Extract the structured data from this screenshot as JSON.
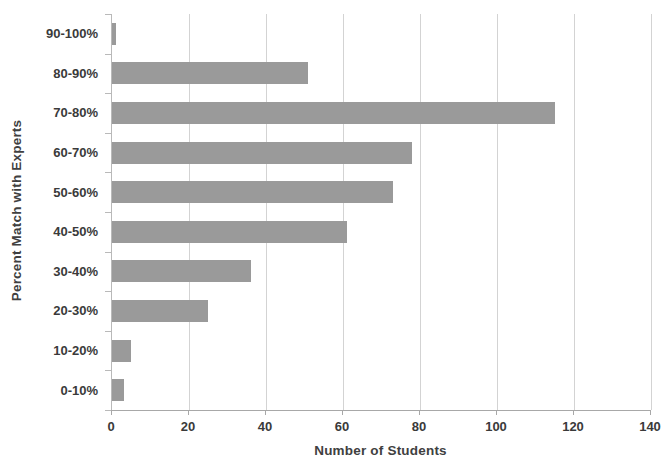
{
  "chart_data": {
    "type": "bar",
    "orientation": "horizontal",
    "title": "",
    "xlabel": "Number of Students",
    "ylabel": "Percent Match with Experts",
    "categories": [
      "0-10%",
      "10-20%",
      "20-30%",
      "30-40%",
      "40-50%",
      "50-60%",
      "60-70%",
      "70-80%",
      "80-90%",
      "90-100%"
    ],
    "values": [
      3,
      5,
      25,
      36,
      61,
      73,
      78,
      115,
      51,
      1
    ],
    "series": [
      {
        "name": "Number of Students",
        "values": [
          3,
          5,
          25,
          36,
          61,
          73,
          78,
          115,
          51,
          1
        ]
      }
    ],
    "xlim": [
      0,
      140
    ],
    "xticks": [
      0,
      20,
      40,
      60,
      80,
      100,
      120,
      140
    ],
    "xtick_labels": [
      "0",
      "20",
      "40",
      "60",
      "80",
      "100",
      "120",
      "140"
    ],
    "ytick_labels_top_to_bottom": [
      "90-100%",
      "80-90%",
      "70-80%",
      "60-70%",
      "50-60%",
      "40-50%",
      "30-40%",
      "20-30%",
      "10-20%",
      "0-10%"
    ],
    "bars_top_to_bottom": [
      {
        "label": "90-100%",
        "value": 1
      },
      {
        "label": "80-90%",
        "value": 51
      },
      {
        "label": "70-80%",
        "value": 115
      },
      {
        "label": "60-70%",
        "value": 78
      },
      {
        "label": "50-60%",
        "value": 73
      },
      {
        "label": "40-50%",
        "value": 61
      },
      {
        "label": "30-40%",
        "value": 36
      },
      {
        "label": "20-30%",
        "value": 25
      },
      {
        "label": "10-20%",
        "value": 5
      },
      {
        "label": "0-10%",
        "value": 3
      }
    ],
    "grid": true,
    "grid_axis": "x",
    "legend": false,
    "colors": {
      "bar": "#9a9a9a",
      "gridline": "#d3d3d3",
      "axis": "#a8a8a8",
      "text": "#3a3a3a",
      "background": "#ffffff"
    }
  }
}
